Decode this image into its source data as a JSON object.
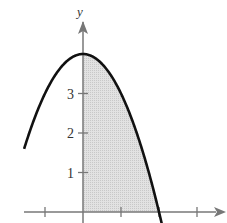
{
  "chart_data": {
    "type": "line",
    "title": "",
    "function": "y = 4 - x^2",
    "xlabel": "",
    "ylabel": "y",
    "xlim": [
      -2.1,
      3.6
    ],
    "ylim": [
      0,
      4.6
    ],
    "x_ticks": [
      -1,
      0,
      1,
      2,
      3
    ],
    "y_ticks": [
      1,
      2,
      3
    ],
    "y_tick_labels": [
      "1",
      "2",
      "3"
    ],
    "grid": false,
    "legend": null,
    "series": [
      {
        "name": "curve",
        "x": [
          -1.5,
          -1.0,
          -0.5,
          0,
          0.5,
          1.0,
          1.5,
          2.0,
          2.1
        ],
        "values": [
          1.75,
          3.0,
          3.75,
          4.0,
          3.75,
          3.0,
          1.75,
          0.0,
          -0.41
        ]
      }
    ],
    "shaded_region": {
      "from_x": 0,
      "to_x": 2,
      "between": "curve and x-axis",
      "color": "#d9d9d9"
    },
    "colors": {
      "curve": "#111111",
      "axis": "#777777",
      "shade": "#d9d9d9"
    }
  }
}
